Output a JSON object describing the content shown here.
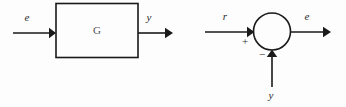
{
  "figure": {
    "background_color": "#fdfdfd",
    "line_color": "#1a1a1a",
    "text_color": "#2b2b2b",
    "width": 346,
    "height": 107
  },
  "left_diagram": {
    "name": "plant-block-diagram",
    "input_label": "e",
    "output_label": "y",
    "block_label": "G",
    "block_label_color": "#555555"
  },
  "right_diagram": {
    "name": "summing-junction-diagram",
    "reference_label": "r",
    "output_label": "e",
    "feedback_label": "y",
    "positive_sign": "+",
    "negative_sign": "−"
  }
}
